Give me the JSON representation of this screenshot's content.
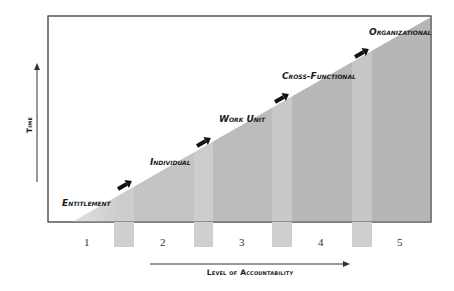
{
  "diagram": {
    "title": "",
    "y_axis_label": "Time",
    "x_axis_label": "Level of Accountability",
    "levels": [
      {
        "number": "1",
        "label": "Entitlement"
      },
      {
        "number": "2",
        "label": "Individual"
      },
      {
        "number": "3",
        "label": "Work Unit"
      },
      {
        "number": "4",
        "label": "Cross-Functional"
      },
      {
        "number": "5",
        "label": "Organizational"
      }
    ],
    "colors": {
      "frame": "#555555",
      "fill_light": "#cfcfcf",
      "fill_mid": "#bdbdbd",
      "separator": "#d6d6d6",
      "arrow": "#111111"
    }
  }
}
